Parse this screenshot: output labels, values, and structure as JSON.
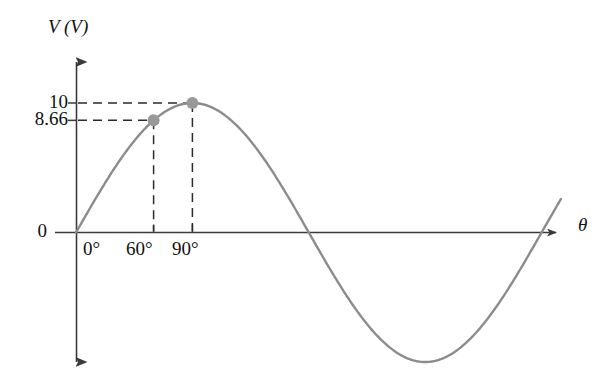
{
  "chart_data": {
    "type": "line",
    "title": "",
    "subtitle": "",
    "xlabel": "θ",
    "ylabel": "V (V)",
    "grid": false,
    "legend": null,
    "curve": {
      "name": "V = 10 sin θ",
      "equation": "V(θ) = 10 sin(θ)",
      "amplitude": 10,
      "x_start_deg": 0,
      "x_end_deg": 375,
      "color": "#8c8c8c"
    },
    "xlim_deg": [
      0,
      375
    ],
    "ylim": [
      -10,
      10
    ],
    "x_ticks_deg": [
      0,
      60,
      90
    ],
    "x_tick_labels": [
      "0°",
      "60°",
      "90°"
    ],
    "y_ticks": [
      0,
      8.66,
      10
    ],
    "y_tick_labels": [
      "0",
      "8.66",
      "10"
    ],
    "points": [
      {
        "label": "60° point",
        "x_deg": 60,
        "y": 8.66,
        "x_tick_label": "60°",
        "y_tick_label": "8.66",
        "color": "#999999"
      },
      {
        "label": "90° point",
        "x_deg": 90,
        "y": 10,
        "x_tick_label": "90°",
        "y_tick_label": "10",
        "color": "#999999"
      }
    ],
    "guide_lines": [
      {
        "from": "y-axis 10",
        "to": "90° point",
        "orientation": "horizontal",
        "style": "dashed"
      },
      {
        "from": "y-axis 8.66",
        "to": "60° point",
        "orientation": "horizontal",
        "style": "dashed"
      },
      {
        "from": "90° point",
        "to": "x-axis 90°",
        "orientation": "vertical",
        "style": "dashed"
      },
      {
        "from": "60° point",
        "to": "x-axis 60°",
        "orientation": "vertical",
        "style": "dashed"
      }
    ]
  },
  "labels": {
    "y_axis_title": "V (V)",
    "x_axis_title": "θ",
    "y_10": "10",
    "y_866": "8.66",
    "y_0": "0",
    "x_0": "0°",
    "x_60": "60°",
    "x_90": "90°"
  },
  "colors": {
    "curve": "#8c8c8c",
    "point": "#999999",
    "axis": "#3a3a3a",
    "dash": "#2b2b2b",
    "text": "#111111",
    "background": "#ffffff"
  }
}
